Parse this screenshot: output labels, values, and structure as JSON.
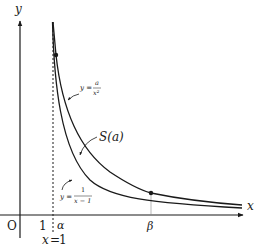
{
  "diagram": {
    "axes": {
      "x_label": "x",
      "y_label": "y",
      "origin_label": "O"
    },
    "ticks": {
      "one": "1",
      "alpha": "α",
      "beta": "β"
    },
    "asymptote": {
      "label_lhs": "x",
      "label_eq": "=",
      "label_rhs": "1",
      "style": "dashed"
    },
    "curves": [
      {
        "name": "y = a/x^2",
        "label_prefix": "y =",
        "numerator": "a",
        "denominator": "x²"
      },
      {
        "name": "y = 1/(x-1)",
        "label_prefix": "y =",
        "numerator": "1",
        "denominator": "x − 1"
      }
    ],
    "region": {
      "label": "S(a)"
    },
    "intersections": [
      {
        "name": "alpha-point",
        "x_label": "α"
      },
      {
        "name": "beta-point",
        "x_label": "β"
      }
    ],
    "colors": {
      "ink": "#1a1a1a",
      "background": "#ffffff"
    }
  }
}
